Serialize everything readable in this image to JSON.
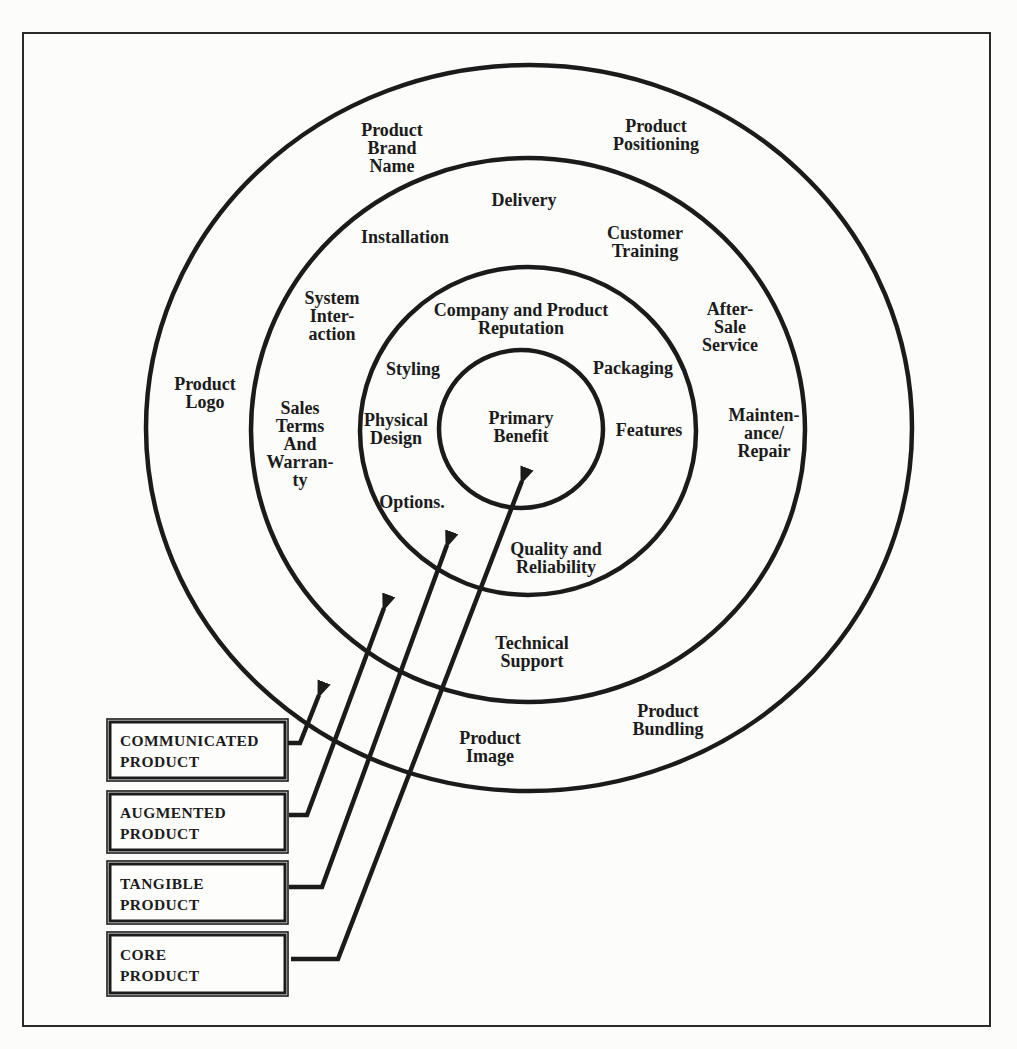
{
  "figure": {
    "ink_color": "#1b1b1b",
    "paper_color": "#fcfcfa",
    "rings": {
      "core": {
        "legend": [
          "CORE",
          "PRODUCT"
        ],
        "labels": {
          "primary_benefit": [
            "Primary",
            "Benefit"
          ]
        }
      },
      "tangible": {
        "legend": [
          "TANGIBLE",
          "PRODUCT"
        ],
        "labels": {
          "company_and_product_reputation": [
            "Company and Product",
            "Reputation"
          ],
          "styling": [
            "Styling"
          ],
          "packaging": [
            "Packaging"
          ],
          "physical_design": [
            "Physical",
            "Design"
          ],
          "features": [
            "Features"
          ],
          "options": [
            "Options."
          ],
          "quality_and_reliability": [
            "Quality and",
            "Reliability"
          ]
        }
      },
      "augmented": {
        "legend": [
          "AUGMENTED",
          "PRODUCT"
        ],
        "labels": {
          "delivery": [
            "Delivery"
          ],
          "installation": [
            "Installation"
          ],
          "customer_training": [
            "Customer",
            "Training"
          ],
          "system_interaction": [
            "System",
            "Inter-",
            "action"
          ],
          "after_sale_service": [
            "After-",
            "Sale",
            "Service"
          ],
          "sales_terms_and_warranty": [
            "Sales",
            "Terms",
            "And",
            "Warran-",
            "ty"
          ],
          "maintenance_repair": [
            "Mainten-",
            "ance/",
            "Repair"
          ],
          "technical_support": [
            "Technical",
            "Support"
          ]
        }
      },
      "communicated": {
        "legend": [
          "COMMUNICATED",
          "PRODUCT"
        ],
        "labels": {
          "product_brand_name": [
            "Product",
            "Brand",
            "Name"
          ],
          "product_positioning": [
            "Product",
            "Positioning"
          ],
          "product_logo": [
            "Product",
            "Logo"
          ],
          "product_bundling": [
            "Product",
            "Bundling"
          ],
          "product_image": [
            "Product",
            "Image"
          ]
        }
      }
    }
  }
}
